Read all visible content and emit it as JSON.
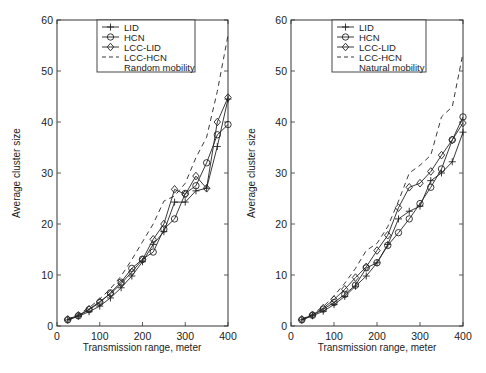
{
  "figure": {
    "width": 486,
    "height": 373
  },
  "chart_data": [
    {
      "type": "line",
      "title": "",
      "annotation": "Random mobility",
      "xlabel": "Transmission range, meter",
      "ylabel": "Average cluster size",
      "xlim": [
        0,
        400
      ],
      "ylim": [
        0,
        60
      ],
      "xticks": [
        0,
        100,
        200,
        300,
        400
      ],
      "yticks": [
        0,
        10,
        20,
        30,
        40,
        50,
        60
      ],
      "grid": false,
      "legend_position": "upper-center",
      "x": [
        25,
        50,
        75,
        100,
        125,
        150,
        175,
        200,
        225,
        250,
        275,
        300,
        325,
        350,
        375,
        400
      ],
      "series": [
        {
          "name": "LID",
          "marker": "plus",
          "dash": false,
          "values": [
            1.2,
            1.9,
            2.8,
            3.9,
            5.5,
            7.5,
            9.8,
            12.6,
            16.0,
            18.5,
            24.3,
            24.3,
            26.5,
            27.0,
            35.2,
            44.5
          ]
        },
        {
          "name": "HCN",
          "marker": "circle",
          "dash": false,
          "values": [
            1.2,
            2.0,
            3.2,
            4.6,
            6.5,
            8.6,
            11.3,
            13.1,
            14.5,
            19.0,
            21.0,
            26.0,
            27.5,
            32.0,
            37.5,
            39.5
          ]
        },
        {
          "name": "LCC-LID",
          "marker": "diamond",
          "dash": false,
          "values": [
            1.3,
            2.1,
            3.3,
            4.8,
            6.3,
            8.3,
            10.6,
            13.0,
            17.0,
            20.0,
            26.8,
            25.8,
            29.4,
            27.0,
            40.0,
            44.8
          ]
        },
        {
          "name": "LCC-HCN",
          "marker": "none",
          "dash": true,
          "values": [
            1.3,
            2.3,
            3.6,
            5.3,
            7.3,
            9.8,
            13.0,
            16.5,
            20.0,
            24.5,
            25.5,
            28.0,
            33.0,
            37.0,
            46.0,
            57.0
          ]
        }
      ]
    },
    {
      "type": "line",
      "title": "",
      "annotation": "Natural mobility",
      "xlabel": "Transmission range, meter",
      "ylabel": "Average cluster size",
      "xlim": [
        0,
        400
      ],
      "ylim": [
        0,
        60
      ],
      "xticks": [
        0,
        100,
        200,
        300,
        400
      ],
      "yticks": [
        0,
        10,
        20,
        30,
        40,
        50,
        60
      ],
      "grid": false,
      "legend_position": "upper-center",
      "x": [
        25,
        50,
        75,
        100,
        125,
        150,
        175,
        200,
        225,
        250,
        275,
        300,
        325,
        350,
        375,
        400
      ],
      "series": [
        {
          "name": "LID",
          "marker": "plus",
          "dash": false,
          "values": [
            1.2,
            2.0,
            2.9,
            4.2,
            5.8,
            7.8,
            9.8,
            12.4,
            16.0,
            21.0,
            22.5,
            23.5,
            28.5,
            30.0,
            32.2,
            38.0
          ]
        },
        {
          "name": "HCN",
          "marker": "circle",
          "dash": false,
          "values": [
            1.2,
            2.1,
            3.3,
            4.6,
            6.2,
            8.0,
            11.4,
            12.4,
            15.8,
            18.3,
            21.0,
            24.0,
            27.2,
            30.8,
            36.5,
            41.0
          ]
        },
        {
          "name": "LCC-LID",
          "marker": "diamond",
          "dash": false,
          "values": [
            1.3,
            2.2,
            3.5,
            5.2,
            7.2,
            9.5,
            11.6,
            14.8,
            17.8,
            23.2,
            27.2,
            28.0,
            30.3,
            33.5,
            36.5,
            39.8
          ]
        },
        {
          "name": "LCC-HCN",
          "marker": "none",
          "dash": true,
          "values": [
            1.3,
            2.4,
            3.8,
            5.9,
            8.4,
            11.3,
            14.8,
            16.2,
            19.5,
            24.5,
            30.0,
            31.5,
            33.5,
            41.0,
            43.0,
            53.5
          ]
        }
      ]
    }
  ],
  "panels": [
    {
      "id": "left",
      "plot_box": {
        "x0": 57,
        "x1": 228,
        "y0": 326,
        "y1": 20
      },
      "legend_box": {
        "x": 97,
        "y": 20,
        "w": 98,
        "h": 52
      },
      "xlabel_pos": {
        "x": 142,
        "y": 351
      },
      "ylabel_pos": {
        "x": 20,
        "y": 173
      }
    },
    {
      "id": "right",
      "plot_box": {
        "x0": 291,
        "x1": 463,
        "y0": 326,
        "y1": 20
      },
      "legend_box": {
        "x": 332,
        "y": 20,
        "w": 94,
        "h": 52
      },
      "xlabel_pos": {
        "x": 377,
        "y": 351
      },
      "ylabel_pos": {
        "x": 255,
        "y": 173
      }
    }
  ],
  "colors": {
    "line": "#222222",
    "axis": "#333333",
    "background": "#ffffff"
  }
}
